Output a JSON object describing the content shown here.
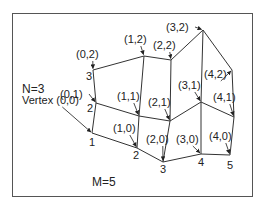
{
  "diagram": {
    "title_n": "N=3",
    "title_m": "M=5",
    "vertex_prefix_label": "Vertex (0,0)",
    "vertices": [
      {
        "id": "(0,0)",
        "x": 92,
        "y": 133,
        "label": "Vertex (0,0)",
        "lx": 22,
        "ly": 104,
        "num": "1",
        "nx": 89,
        "ny": 146
      },
      {
        "id": "(0,1)",
        "x": 96,
        "y": 103,
        "label": "(0,1)",
        "lx": 60,
        "ly": 98,
        "num": "2",
        "nx": 87,
        "ny": 112
      },
      {
        "id": "(0,2)",
        "x": 93,
        "y": 70,
        "label": "(0,2)",
        "lx": 76,
        "ly": 58,
        "num": "3",
        "nx": 86,
        "ny": 80
      },
      {
        "id": "(1,0)",
        "x": 137,
        "y": 148,
        "label": "(1,0)",
        "lx": 113,
        "ly": 132,
        "num": "2",
        "nx": 133,
        "ny": 159
      },
      {
        "id": "(1,1)",
        "x": 139,
        "y": 116,
        "label": "(1,1)",
        "lx": 117,
        "ly": 100,
        "num": "",
        "nx": 0,
        "ny": 0
      },
      {
        "id": "(1,2)",
        "x": 144,
        "y": 56,
        "label": "(1,2)",
        "lx": 124,
        "ly": 43,
        "num": "",
        "nx": 0,
        "ny": 0
      },
      {
        "id": "(2,0)",
        "x": 163,
        "y": 162,
        "label": "(2,0)",
        "lx": 146,
        "ly": 143,
        "num": "3",
        "nx": 160,
        "ny": 173
      },
      {
        "id": "(2,1)",
        "x": 170,
        "y": 121,
        "label": "(2,1)",
        "lx": 148,
        "ly": 106,
        "num": "",
        "nx": 0,
        "ny": 0
      },
      {
        "id": "(2,2)",
        "x": 171,
        "y": 60,
        "label": "(2,2)",
        "lx": 153,
        "ly": 49,
        "num": "",
        "nx": 0,
        "ny": 0
      },
      {
        "id": "(3,0)",
        "x": 201,
        "y": 154,
        "label": "(3,0)",
        "lx": 176,
        "ly": 143,
        "num": "4",
        "nx": 198,
        "ny": 166
      },
      {
        "id": "(3,1)",
        "x": 201,
        "y": 102,
        "label": "(3,1)",
        "lx": 178,
        "ly": 89,
        "num": "",
        "nx": 0,
        "ny": 0
      },
      {
        "id": "(3,2)",
        "x": 203,
        "y": 30,
        "label": "(3,2)",
        "lx": 166,
        "ly": 31,
        "num": "",
        "nx": 0,
        "ny": 0
      },
      {
        "id": "(4,0)",
        "x": 230,
        "y": 155,
        "label": "(4,0)",
        "lx": 209,
        "ly": 140,
        "num": "5",
        "nx": 227,
        "ny": 169
      },
      {
        "id": "(4,1)",
        "x": 234,
        "y": 117,
        "label": "(4,1)",
        "lx": 213,
        "ly": 101,
        "num": "",
        "nx": 0,
        "ny": 0
      },
      {
        "id": "(4,2)",
        "x": 232,
        "y": 70,
        "label": "(4,2)",
        "lx": 204,
        "ly": 78,
        "num": "",
        "nx": 0,
        "ny": 0
      }
    ],
    "columns": [
      "(0,0)|(0,1)|(0,2)",
      "(1,0)|(1,1)|(1,2)",
      "(2,0)|(2,1)|(2,2)",
      "(3,0)|(3,1)|(3,2)",
      "(4,0)|(4,1)|(4,2)"
    ]
  }
}
